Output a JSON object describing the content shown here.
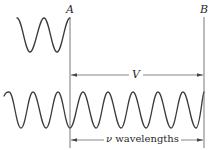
{
  "diagram": {
    "labels": {
      "point_a": "A",
      "point_b": "B",
      "distance": "V",
      "nu_symbol": "ν",
      "wavelengths_text": " wavelengths"
    },
    "top_wave": {
      "cycles_shown": 2,
      "ends_at": "A"
    },
    "bottom_wave": {
      "cycles_shown": 8,
      "spans": "left edge to B"
    },
    "colors": {
      "stroke": "#3a3a3a",
      "background": "#ffffff"
    }
  }
}
